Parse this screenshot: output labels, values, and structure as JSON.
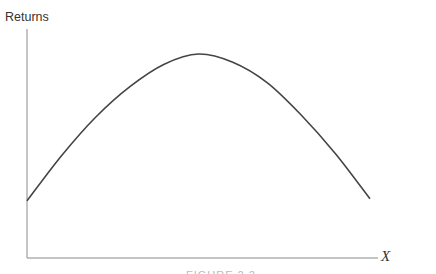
{
  "chart_data": {
    "type": "line",
    "title": "",
    "xlabel": "X",
    "ylabel": "Returns",
    "grid": false,
    "legend": null,
    "ticks": {
      "x": [],
      "y": []
    },
    "series": [
      {
        "name": "Returns",
        "x": [
          0,
          0.1,
          0.2,
          0.3,
          0.4,
          0.5,
          0.6,
          0.7,
          0.8,
          0.9,
          1.0
        ],
        "values": [
          0.28,
          0.5,
          0.69,
          0.84,
          0.95,
          1.0,
          0.96,
          0.86,
          0.7,
          0.51,
          0.29
        ]
      }
    ],
    "xlim": [
      0,
      1.03
    ],
    "ylim": [
      0,
      1.17
    ]
  },
  "caption_partial": "FIGURE 2.2"
}
